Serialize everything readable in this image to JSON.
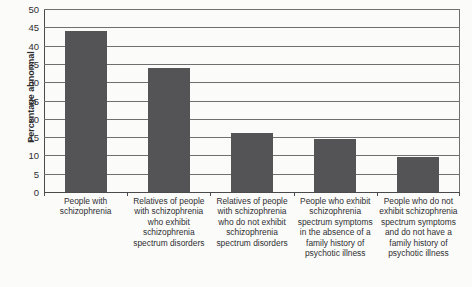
{
  "chart_data": {
    "type": "bar",
    "title": "",
    "xlabel": "",
    "ylabel": "Percentage abnormal",
    "ylim": [
      0,
      50
    ],
    "ytick_step": 5,
    "grid": true,
    "legend": false,
    "bar_color": "#545456",
    "categories": [
      "People with schizophrenia",
      "Relatives of people with schizophrenia who exhibit schizophrenia spectrum disorders",
      "Relatives of people with schizophrenia who do not exhibit schizophrenia spectrum disorders",
      "People who exhibit schizophrenia spectrum symptoms in the absence of a family history of psychotic illness",
      "People who do not exhibit schizophrenia spectrum symptoms and do not have a family history of psychotic illness"
    ],
    "values": [
      44,
      34,
      16,
      14.5,
      9.5
    ],
    "yticks": [
      0,
      5,
      10,
      15,
      20,
      25,
      30,
      35,
      40,
      45,
      50
    ],
    "ytick_labels": [
      "0",
      "5",
      "10",
      "15",
      "20",
      "25",
      "30",
      "35",
      "40",
      "45",
      "50"
    ]
  }
}
